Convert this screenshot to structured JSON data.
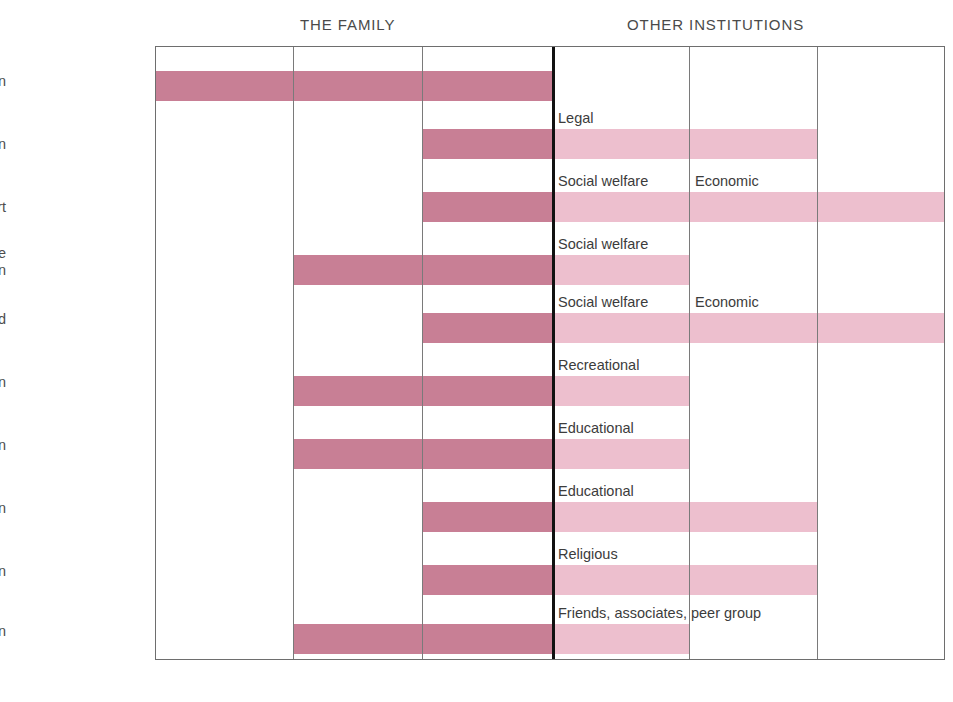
{
  "headers": {
    "family": "THE FAMILY",
    "other": "OTHER INSTITUTIONS"
  },
  "colors": {
    "bar_dark": "#c87f95",
    "bar_light": "#edbfce",
    "grid_line": "#7a7a7a",
    "divider_thick": "#111111",
    "text": "#4d4d4d",
    "background": "#ffffff"
  },
  "rows": [
    {
      "label": "Procreation",
      "annotation": ""
    },
    {
      "label": "Protection",
      "annotation": "Legal"
    },
    {
      "label": "Support",
      "annotation": "Social welfare"
    },
    {
      "label": "Child care\nand protection",
      "annotation": "Social welfare"
    },
    {
      "label": "Mutual aid",
      "annotation": "Social welfare"
    },
    {
      "label": "Recreation",
      "annotation": "Recreational"
    },
    {
      "label": "Socialization",
      "annotation": "Educational"
    },
    {
      "label": "Education",
      "annotation": "Educational"
    },
    {
      "label": "Religion",
      "annotation": "Religious"
    },
    {
      "label": "Love and affection",
      "annotation": "Friends, associates, peer group"
    }
  ],
  "secondary_annotations": [
    {
      "row": 2,
      "text": "Economic"
    },
    {
      "row": 4,
      "text": "Economic"
    }
  ],
  "chart_data": {
    "type": "bar",
    "title": "",
    "xlabel": "",
    "ylabel": "",
    "grid": true,
    "legend_position": "none",
    "columns": [
      {
        "index": 0,
        "group": "THE FAMILY"
      },
      {
        "index": 1,
        "group": "THE FAMILY"
      },
      {
        "index": 2,
        "group": "THE FAMILY"
      },
      {
        "index": 3,
        "group": "OTHER INSTITUTIONS"
      },
      {
        "index": 4,
        "group": "OTHER INSTITUTIONS"
      },
      {
        "index": 5,
        "group": "OTHER INSTITUTIONS"
      }
    ],
    "categories": [
      "Procreation",
      "Protection",
      "Support",
      "Child care and protection",
      "Mutual aid",
      "Recreation",
      "Socialization",
      "Education",
      "Religion",
      "Love and affection"
    ],
    "series": [
      {
        "name": "Family involvement",
        "shade": "dark",
        "spans": [
          {
            "category": "Procreation",
            "start_col": 0,
            "end_col": 3
          },
          {
            "category": "Protection",
            "start_col": 2,
            "end_col": 3
          },
          {
            "category": "Support",
            "start_col": 2,
            "end_col": 3
          },
          {
            "category": "Child care and protection",
            "start_col": 1,
            "end_col": 3
          },
          {
            "category": "Mutual aid",
            "start_col": 2,
            "end_col": 3
          },
          {
            "category": "Recreation",
            "start_col": 1,
            "end_col": 3
          },
          {
            "category": "Socialization",
            "start_col": 1,
            "end_col": 3
          },
          {
            "category": "Education",
            "start_col": 2,
            "end_col": 3
          },
          {
            "category": "Religion",
            "start_col": 2,
            "end_col": 3
          },
          {
            "category": "Love and affection",
            "start_col": 1,
            "end_col": 3
          }
        ]
      },
      {
        "name": "Other institutions involvement",
        "shade": "light",
        "spans": [
          {
            "category": "Protection",
            "start_col": 3,
            "end_col": 5
          },
          {
            "category": "Support",
            "start_col": 3,
            "end_col": 6
          },
          {
            "category": "Child care and protection",
            "start_col": 3,
            "end_col": 4
          },
          {
            "category": "Mutual aid",
            "start_col": 3,
            "end_col": 6
          },
          {
            "category": "Recreation",
            "start_col": 3,
            "end_col": 4
          },
          {
            "category": "Socialization",
            "start_col": 3,
            "end_col": 4
          },
          {
            "category": "Education",
            "start_col": 3,
            "end_col": 5
          },
          {
            "category": "Religion",
            "start_col": 3,
            "end_col": 5
          },
          {
            "category": "Love and affection",
            "start_col": 3,
            "end_col": 4
          }
        ]
      }
    ],
    "annotations": [
      {
        "category": "Protection",
        "col": 3,
        "text": "Legal"
      },
      {
        "category": "Support",
        "col": 3,
        "text": "Social welfare"
      },
      {
        "category": "Support",
        "col": 4,
        "text": "Economic"
      },
      {
        "category": "Child care and protection",
        "col": 3,
        "text": "Social welfare"
      },
      {
        "category": "Mutual aid",
        "col": 3,
        "text": "Social welfare"
      },
      {
        "category": "Mutual aid",
        "col": 4,
        "text": "Economic"
      },
      {
        "category": "Recreation",
        "col": 3,
        "text": "Recreational"
      },
      {
        "category": "Socialization",
        "col": 3,
        "text": "Educational"
      },
      {
        "category": "Education",
        "col": 3,
        "text": "Educational"
      },
      {
        "category": "Religion",
        "col": 3,
        "text": "Religious"
      },
      {
        "category": "Love and affection",
        "col": 3,
        "text": "Friends, associates, peer group"
      }
    ]
  },
  "geometry": {
    "col_edges_px": [
      0,
      137,
      266,
      396,
      533,
      661,
      790
    ],
    "row_label_y_px": [
      75,
      138,
      201,
      255,
      313,
      376,
      439,
      502,
      565,
      625
    ],
    "bar_y_px": [
      24,
      82,
      145,
      208,
      266,
      329,
      392,
      455,
      518,
      577
    ],
    "bar_height_px": 30,
    "thick_divider_col": 3
  }
}
